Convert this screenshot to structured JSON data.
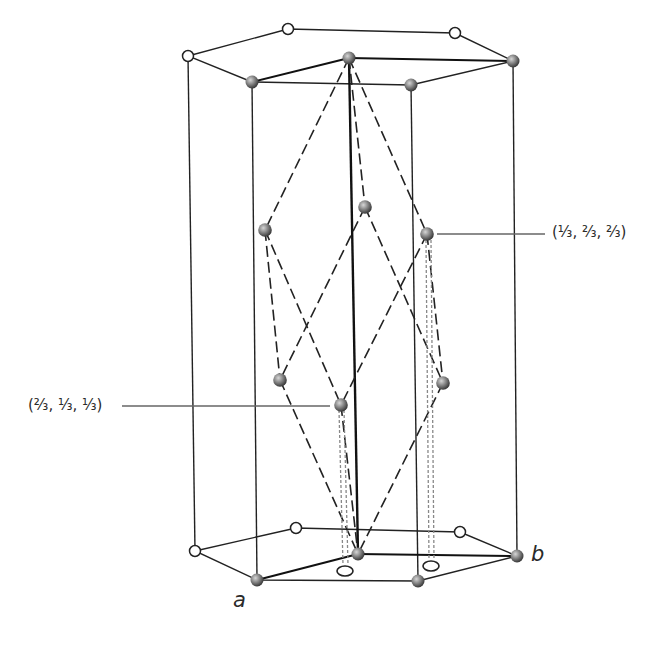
{
  "figure": {
    "annotations": {
      "upper_right": "(⅓, ⅔, ⅔)",
      "lower_left": "(⅔, ⅓, ⅓)"
    },
    "axis_labels": {
      "a": "a",
      "b": "b"
    },
    "colors": {
      "line": "#222222",
      "shaded_atom_light": "#b8b8b8",
      "shaded_atom_dark": "#3a3a3a",
      "open_atom_fill": "#ffffff",
      "leader_line": "#666666",
      "projection_line": "#777777"
    },
    "atoms": {
      "top_open": [
        [
          188,
          56
        ],
        [
          288,
          29
        ],
        [
          455,
          33
        ]
      ],
      "top_shaded": [
        [
          252,
          82
        ],
        [
          411,
          85
        ],
        [
          513,
          61
        ],
        [
          349,
          58
        ]
      ],
      "bottom_open": [
        [
          195,
          551
        ],
        [
          296,
          528
        ],
        [
          460,
          532
        ]
      ],
      "bottom_shaded": [
        [
          257,
          580
        ],
        [
          418,
          581
        ],
        [
          517,
          556
        ],
        [
          358,
          554
        ]
      ],
      "interior_shaded": [
        [
          265,
          230
        ],
        [
          365,
          207
        ],
        [
          427,
          234
        ],
        [
          280,
          380
        ],
        [
          341,
          405
        ],
        [
          443,
          383
        ]
      ],
      "projection_rings": [
        [
          345,
          571
        ],
        [
          431,
          566
        ]
      ]
    }
  }
}
